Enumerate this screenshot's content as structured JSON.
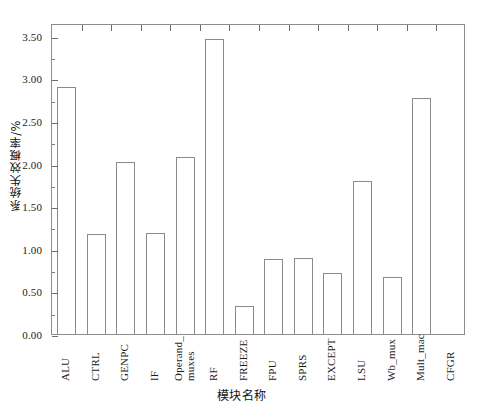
{
  "chart_data": {
    "type": "bar",
    "title": "",
    "subtitle": "",
    "xlabel": "模块名称",
    "ylabel": "系统失效概率/%",
    "categories": [
      "ALU",
      "CTRL",
      "GENPC",
      "IF",
      "Operand_\nmuxes",
      "RF",
      "FREEZE",
      "FPU",
      "SPRS",
      "EXCEPT",
      "LSU",
      "Wb_mux",
      "Mult_mac",
      "CFGR"
    ],
    "values": [
      2.9,
      1.17,
      2.02,
      1.19,
      2.08,
      3.46,
      0.33,
      0.88,
      0.89,
      0.72,
      1.8,
      0.67,
      2.77,
      0.0
    ],
    "ylim": [
      0.0,
      3.65
    ],
    "ytick_labels": [
      "0.00",
      "0.50",
      "1.00",
      "1.50",
      "2.00",
      "2.50",
      "3.00",
      "3.50"
    ],
    "ytick_values": [
      0.0,
      0.5,
      1.0,
      1.5,
      2.0,
      2.5,
      3.0,
      3.5
    ],
    "yminor_values": [
      0.25,
      0.75,
      1.25,
      1.75,
      2.25,
      2.75,
      3.25
    ],
    "grid": false,
    "legend": false,
    "bar_fill": "#ffffff",
    "bar_edge": "#8a8a8a",
    "axis_color": "#8d8d8d"
  }
}
